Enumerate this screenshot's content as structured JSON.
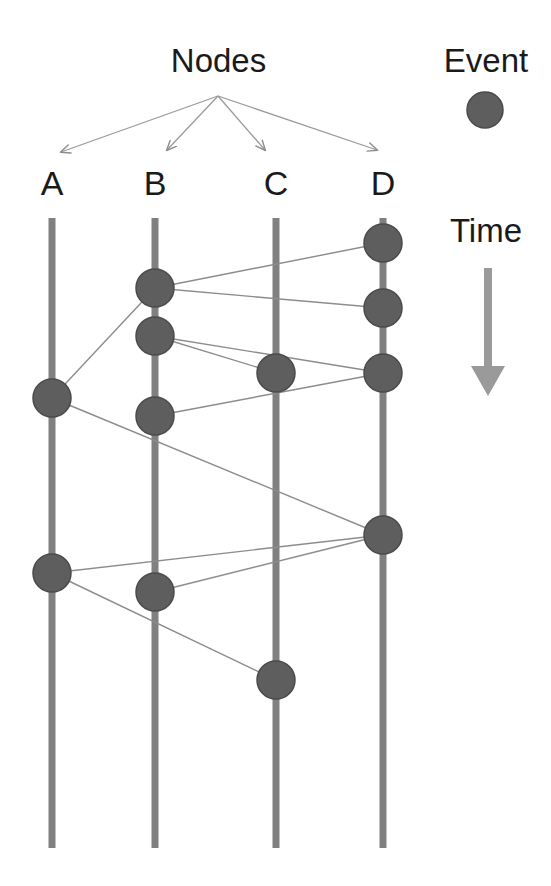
{
  "canvas": {
    "width": 551,
    "height": 886,
    "background": "#ffffff"
  },
  "labels": {
    "nodes_title": "Nodes",
    "event_title": "Event",
    "time_title": "Time"
  },
  "style": {
    "lifeline_color": "#808080",
    "event_fill": "#5e5e5e",
    "event_stroke": "#4a4a4a",
    "edge_color": "#8c8c8c",
    "arrow_color": "#808080",
    "pointer_color": "#9a9a9a",
    "text_color": "#1a1a1a",
    "lifeline_width": 7,
    "event_radius": 19,
    "edge_width": 1.4
  },
  "chart_data": {
    "type": "diagram",
    "diagram_kind": "lamport-spacetime-diagram",
    "title": "Nodes",
    "legend": [
      {
        "key": "event",
        "label": "Event",
        "shape": "filled-circle",
        "color": "#5e5e5e"
      }
    ],
    "time_axis": {
      "label": "Time",
      "direction": "downward",
      "arrow_from": {
        "x": 488,
        "y": 268
      },
      "arrow_to": {
        "x": 488,
        "y": 396
      }
    },
    "lifelines": [
      {
        "id": "A",
        "label": "A",
        "x": 52,
        "y_top": 218,
        "y_bottom": 848
      },
      {
        "id": "B",
        "label": "B",
        "x": 155,
        "y_top": 218,
        "y_bottom": 848
      },
      {
        "id": "C",
        "label": "C",
        "x": 276,
        "y_top": 218,
        "y_bottom": 848
      },
      {
        "id": "D",
        "label": "D",
        "x": 383,
        "y_top": 218,
        "y_bottom": 848
      }
    ],
    "events": [
      {
        "id": "A1",
        "node": "A",
        "x": 52,
        "y": 398
      },
      {
        "id": "A2",
        "node": "A",
        "x": 52,
        "y": 573
      },
      {
        "id": "B1",
        "node": "B",
        "x": 155,
        "y": 288
      },
      {
        "id": "B2",
        "node": "B",
        "x": 155,
        "y": 336
      },
      {
        "id": "B3",
        "node": "B",
        "x": 155,
        "y": 416
      },
      {
        "id": "B4",
        "node": "B",
        "x": 155,
        "y": 592
      },
      {
        "id": "C1",
        "node": "C",
        "x": 276,
        "y": 373
      },
      {
        "id": "C2",
        "node": "C",
        "x": 276,
        "y": 680
      },
      {
        "id": "D1",
        "node": "D",
        "x": 383,
        "y": 243
      },
      {
        "id": "D2",
        "node": "D",
        "x": 383,
        "y": 308
      },
      {
        "id": "D3",
        "node": "D",
        "x": 383,
        "y": 373
      },
      {
        "id": "D4",
        "node": "D",
        "x": 383,
        "y": 535
      }
    ],
    "messages": [
      {
        "from": "A1",
        "to": "B1"
      },
      {
        "from": "B1",
        "to": "D1"
      },
      {
        "from": "B1",
        "to": "D2"
      },
      {
        "from": "B2",
        "to": "C1"
      },
      {
        "from": "B2",
        "to": "D3"
      },
      {
        "from": "B3",
        "to": "D3"
      },
      {
        "from": "A1",
        "to": "D4"
      },
      {
        "from": "A2",
        "to": "D4"
      },
      {
        "from": "B4",
        "to": "D4"
      },
      {
        "from": "A2",
        "to": "C2"
      }
    ],
    "pointers": {
      "origin": {
        "x": 218,
        "y": 96
      },
      "targets": [
        {
          "node": "A",
          "x": 61,
          "y": 152
        },
        {
          "node": "B",
          "x": 167,
          "y": 150
        },
        {
          "node": "C",
          "x": 265,
          "y": 150
        },
        {
          "node": "D",
          "x": 377,
          "y": 150
        }
      ]
    },
    "legend_marker": {
      "x": 485,
      "y": 110,
      "r": 18
    }
  }
}
